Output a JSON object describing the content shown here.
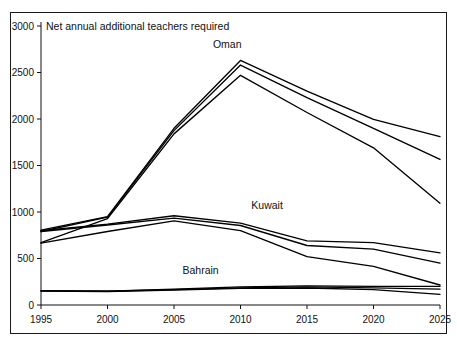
{
  "chart_data": {
    "type": "line",
    "title": "Net annual additional teachers required",
    "xlabel": "",
    "ylabel": "",
    "x": [
      1995,
      2000,
      2005,
      2010,
      2015,
      2020,
      2025
    ],
    "xlim": [
      1995,
      2025
    ],
    "ylim": [
      0,
      3000
    ],
    "yticks": [
      0,
      500,
      1000,
      1500,
      2000,
      2500,
      3000
    ],
    "xticks": [
      1995,
      2000,
      2005,
      2010,
      2015,
      2020,
      2025
    ],
    "xtick_labels": [
      "1995",
      "2000",
      "2005",
      "2010",
      "2015",
      "2020",
      "2025"
    ],
    "ytick_labels": [
      "0",
      "500",
      "1000",
      "1500",
      "2000",
      "2500",
      "3000"
    ],
    "grid": false,
    "legend_position": "inline-annotations",
    "annotations": [
      {
        "text": "Oman",
        "x": 2009,
        "y": 2760
      },
      {
        "text": "Kuwait",
        "x": 2012,
        "y": 1030
      },
      {
        "text": "Bahrain",
        "x": 2007,
        "y": 330
      }
    ],
    "groups": [
      {
        "name": "Oman",
        "label": "Oman",
        "series": [
          {
            "name": "Oman - high",
            "values": [
              805,
              950,
              1900,
              2630,
              2300,
              1995,
              1810
            ]
          },
          {
            "name": "Oman - medium",
            "values": [
              790,
              945,
              1875,
              2580,
              2230,
              1900,
              1565
            ]
          },
          {
            "name": "Oman - low",
            "values": [
              670,
              930,
              1840,
              2470,
              2070,
              1690,
              1095
            ]
          }
        ]
      },
      {
        "name": "Kuwait",
        "label": "Kuwait",
        "series": [
          {
            "name": "Kuwait - high",
            "values": [
              800,
              870,
              960,
              880,
              690,
              670,
              560
            ]
          },
          {
            "name": "Kuwait - medium",
            "values": [
              790,
              860,
              935,
              855,
              640,
              600,
              450
            ]
          },
          {
            "name": "Kuwait - low",
            "values": [
              665,
              790,
              905,
              800,
              520,
              415,
              215
            ]
          }
        ]
      },
      {
        "name": "Bahrain",
        "label": "Bahrain",
        "series": [
          {
            "name": "Bahrain - high",
            "values": [
              155,
              150,
              170,
              195,
              205,
              200,
              200
            ]
          },
          {
            "name": "Bahrain - medium",
            "values": [
              152,
              148,
              165,
              185,
              195,
              185,
              170
            ]
          },
          {
            "name": "Bahrain - low",
            "values": [
              150,
              145,
              160,
              178,
              183,
              165,
              115
            ]
          }
        ]
      }
    ],
    "colors": {
      "line": "#000000",
      "axis": "#111111",
      "background": "#ffffff",
      "frame": "#1a1a1a"
    }
  }
}
